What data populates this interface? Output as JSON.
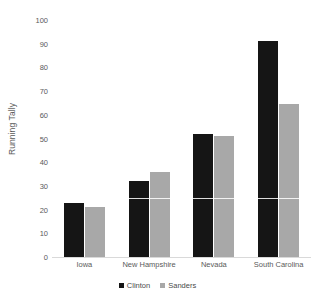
{
  "chart_data": {
    "type": "bar",
    "title": "",
    "subtitle": "",
    "xlabel": "",
    "ylabel": "Running Tally",
    "ylim": [
      0,
      100
    ],
    "ytick_step": 10,
    "yticks": [
      100,
      90,
      80,
      70,
      60,
      50,
      40,
      30,
      20,
      10,
      0
    ],
    "grid": false,
    "legend_position": "bottom",
    "categories": [
      "Iowa",
      "New Hampshire",
      "Nevada",
      "South Carolina"
    ],
    "series": [
      {
        "name": "Clinton",
        "color": "#151515",
        "values": [
          23,
          32,
          52,
          91
        ]
      },
      {
        "name": "Sanders",
        "color": "#a8a8a8",
        "values": [
          21,
          36,
          51,
          64.5
        ]
      }
    ],
    "annotations": []
  },
  "legend": {
    "items": [
      {
        "label": "Clinton",
        "swatch": "clinton"
      },
      {
        "label": "Sanders",
        "swatch": "sanders"
      }
    ]
  },
  "colors": {
    "clinton": "#151515",
    "sanders": "#a8a8a8",
    "axis": "#d9d9d9",
    "text": "#5a5a5a",
    "background": "#ffffff"
  }
}
